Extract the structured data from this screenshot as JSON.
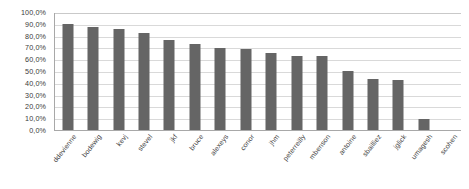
{
  "chart_data": {
    "type": "bar",
    "title": "",
    "xlabel": "",
    "ylabel": "",
    "ylim": [
      0,
      1.0
    ],
    "grid": true,
    "legend": "none",
    "bar_color": "#656565",
    "axis_color": "#a8a8a8",
    "gridline_color": "#d9d9d9",
    "categories": [
      "ddevienne",
      "bodewig",
      "kevj",
      "stevel",
      "jkf",
      "bruce",
      "alexeys",
      "conor",
      "jhm",
      "peterreilly",
      "mbenson",
      "antoine",
      "sbailliez",
      "jglick",
      "umagesh",
      "scohen"
    ],
    "values": [
      0.9,
      0.875,
      0.855,
      0.825,
      0.765,
      0.725,
      0.695,
      0.685,
      0.655,
      0.625,
      0.625,
      0.5,
      0.435,
      0.425,
      0.095,
      0.0
    ],
    "value_labels": [
      "90,0%",
      "87,5%",
      "85,5%",
      "82,5%",
      "76,5%",
      "72,5%",
      "69,5%",
      "68,5%",
      "65,5%",
      "62,5%",
      "62,5%",
      "50,0%",
      "43,5%",
      "42,5%",
      "9,5%",
      "0,0%"
    ],
    "y_ticks": [
      1.0,
      0.9,
      0.8,
      0.7,
      0.6,
      0.5,
      0.4,
      0.3,
      0.2,
      0.1,
      0.0
    ],
    "y_tick_labels": [
      "100,0%",
      "90,0%",
      "80,0%",
      "70,0%",
      "60,0%",
      "50,0%",
      "40,0%",
      "30,0%",
      "20,0%",
      "10,0%",
      "0,0%"
    ]
  }
}
